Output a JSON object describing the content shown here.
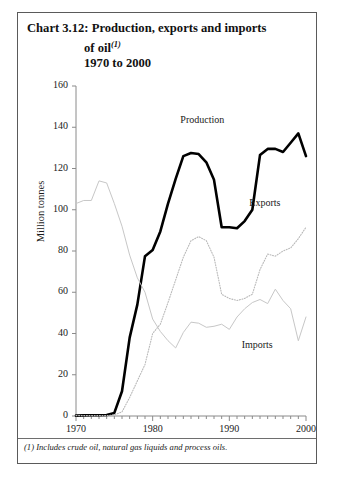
{
  "chart_block": {
    "title_lines": [
      "Chart 3.12: Production, exports and imports",
      "of oil",
      "1970 to 2000"
    ],
    "title_footnote_marker": "(1)",
    "footnote": "(1) Includes crude oil, natural gas liquids and process oils."
  },
  "chart_data": {
    "type": "line",
    "title": "Chart 3.12: Production, exports and imports of oil(1) 1970 to 2000",
    "xlabel": "",
    "ylabel": "Million tonnes",
    "xlim": [
      1970,
      2000
    ],
    "ylim": [
      0,
      160
    ],
    "ytick_labels": [
      "0",
      "20",
      "40",
      "60",
      "80",
      "100",
      "120",
      "140",
      "160"
    ],
    "yticks": [
      0,
      20,
      40,
      60,
      80,
      100,
      120,
      140,
      160
    ],
    "xtick_labels": [
      "1970",
      "1980",
      "1990",
      "2000"
    ],
    "xticks": [
      1970,
      1980,
      1990,
      2000
    ],
    "minor_xtick_interval": 1,
    "grid": false,
    "legend_position": "inline-annotations",
    "x": [
      1970,
      1971,
      1972,
      1973,
      1974,
      1975,
      1976,
      1977,
      1978,
      1979,
      1980,
      1981,
      1982,
      1983,
      1984,
      1985,
      1986,
      1987,
      1988,
      1989,
      1990,
      1991,
      1992,
      1993,
      1994,
      1995,
      1996,
      1997,
      1998,
      1999,
      2000
    ],
    "series": [
      {
        "name": "Production",
        "style": "thick-solid-black",
        "color": "#000000",
        "values": [
          0.2,
          0.3,
          0.4,
          0.4,
          0.5,
          1.5,
          12.0,
          38.0,
          54.0,
          77.5,
          80.5,
          89.5,
          103.0,
          115.0,
          126.0,
          127.5,
          127.0,
          123.0,
          114.5,
          91.5,
          91.5,
          91.0,
          94.5,
          100.0,
          126.5,
          129.5,
          129.5,
          128.0,
          132.5,
          137.0,
          126.0
        ]
      },
      {
        "name": "Exports",
        "style": "dotted-grey",
        "color": "#b9b9b9",
        "values": [
          0.2,
          0.2,
          0.2,
          0.2,
          0.2,
          0.5,
          2.0,
          9.0,
          17.0,
          25.0,
          40.0,
          44.5,
          55.0,
          66.0,
          77.0,
          85.0,
          87.0,
          85.0,
          77.0,
          59.0,
          57.0,
          56.0,
          57.0,
          59.0,
          71.0,
          78.5,
          77.5,
          80.0,
          81.5,
          86.0,
          91.5
        ]
      },
      {
        "name": "Imports",
        "style": "thin-solid-grey",
        "color": "#c7c7c7",
        "values": [
          103.0,
          104.5,
          104.5,
          114.0,
          113.0,
          103.0,
          92.0,
          78.0,
          67.0,
          60.0,
          47.0,
          41.0,
          36.5,
          33.0,
          40.5,
          45.5,
          45.0,
          43.0,
          43.5,
          44.5,
          42.0,
          48.0,
          52.0,
          55.0,
          56.5,
          54.5,
          61.5,
          56.0,
          52.0,
          36.5,
          48.0
        ]
      }
    ],
    "annotations": [
      {
        "text": "Production",
        "x": 1987,
        "y": 143
      },
      {
        "text": "Exports",
        "x": 1996,
        "y": 103
      },
      {
        "text": "Imports",
        "x": 1995,
        "y": 34
      }
    ]
  }
}
